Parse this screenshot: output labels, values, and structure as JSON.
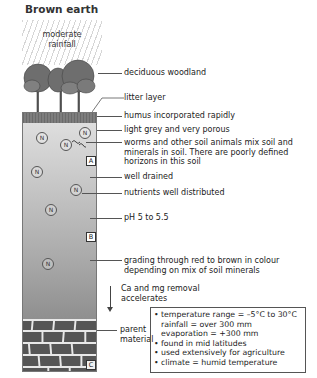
{
  "title": "Brown earth",
  "rain_label": "moderate rainfall",
  "rain_lines": [
    "moderate",
    "rainfall"
  ],
  "horizons": [
    "A",
    "B",
    "C"
  ],
  "nutrient_symbol": "N",
  "labels": {
    "woodland": "deciduous woodland",
    "litter": "litter layer",
    "humus": "humus incorporated rapidly",
    "grey": "light grey and very porous",
    "worms_1": "worms and other soil animals mix soil and",
    "worms_2": "minerals in soil. There are poorly defined",
    "worms_3": "horizons in this soil",
    "drained": "well drained",
    "nutrients": "nutrients well distributed",
    "ph": "pH 5 to 5.5",
    "grading_1": "grading through red to brown in colour",
    "grading_2": "depending on mix of soil minerals",
    "removal_1": "Ca and mg removal",
    "removal_2": "accelerates",
    "parent_1": "parent",
    "parent_2": "material"
  },
  "info_box": [
    {
      "bullet": true,
      "text": "temperature range = –5°C to 30°C"
    },
    {
      "bullet": false,
      "text": "rainfall = over 300 mm"
    },
    {
      "bullet": false,
      "text": "evaporation = +300 mm"
    },
    {
      "bullet": true,
      "text": "found in mid latitudes"
    },
    {
      "bullet": true,
      "text": "used extensively for agriculture"
    },
    {
      "bullet": true,
      "text": "climate = humid temperature"
    }
  ],
  "colors": {
    "humus": "#7d7d7d",
    "soil_top": "#dedede",
    "soil_bottom": "#8f8f8f",
    "bricks": "#555555"
  }
}
